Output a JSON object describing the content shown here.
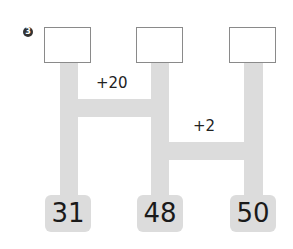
{
  "problem_number": "3",
  "answer_boxes": [
    "",
    "",
    ""
  ],
  "operations": [
    {
      "label": "+20"
    },
    {
      "label": "+2"
    }
  ],
  "start_numbers": [
    "31",
    "48",
    "50"
  ],
  "colors": {
    "track": "#dcdcdc",
    "box_border": "#8a8a8a"
  }
}
